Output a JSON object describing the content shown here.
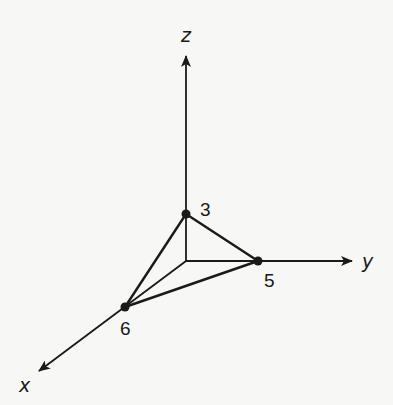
{
  "diagram": {
    "type": "3d-coordinate-axes-tetrahedron",
    "axes": {
      "x": {
        "label": "x"
      },
      "y": {
        "label": "y"
      },
      "z": {
        "label": "z"
      }
    },
    "points": [
      {
        "name": "z-intercept",
        "label": "3",
        "coords": [
          0,
          0,
          3
        ]
      },
      {
        "name": "y-intercept",
        "label": "5",
        "coords": [
          0,
          5,
          0
        ]
      },
      {
        "name": "x-intercept",
        "label": "6",
        "coords": [
          6,
          0,
          0
        ]
      }
    ],
    "colors": {
      "ink": "#1a1a1a",
      "background": "#f7f7f5"
    }
  }
}
